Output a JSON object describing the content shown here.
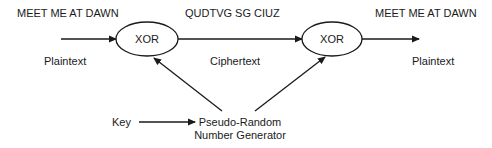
{
  "diagram": {
    "type": "stream-cipher",
    "colors": {
      "stroke": "#1a1a1a",
      "text": "#1a1a1a",
      "background": "#ffffff"
    },
    "messages": {
      "input_message": "MEET ME AT DAWN",
      "cipher_message": "QUDTVG SG CIUZ",
      "output_message": "MEET ME AT DAWN"
    },
    "nodes": {
      "xor_encrypt": "XOR",
      "xor_decrypt": "XOR",
      "prng_line1": "Pseudo-Random",
      "prng_line2": "Number Generator"
    },
    "labels": {
      "input_label": "Plaintext",
      "cipher_label": "Ciphertext",
      "output_label": "Plaintext",
      "key_label": "Key"
    },
    "edges": [
      {
        "from": "plaintext-input",
        "to": "xor_encrypt"
      },
      {
        "from": "xor_encrypt",
        "to": "xor_decrypt",
        "label": "Ciphertext"
      },
      {
        "from": "xor_decrypt",
        "to": "plaintext-output"
      },
      {
        "from": "key",
        "to": "prng"
      },
      {
        "from": "prng",
        "to": "xor_encrypt"
      },
      {
        "from": "prng",
        "to": "xor_decrypt"
      }
    ]
  }
}
